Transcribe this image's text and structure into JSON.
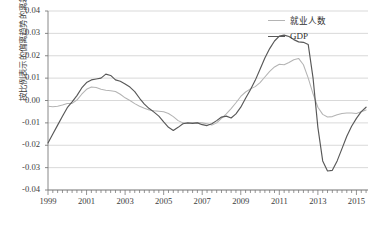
{
  "chart_data": {
    "type": "line",
    "title": "",
    "xlabel": "",
    "ylabel": "按比例表示的偏离趋势的离差",
    "xlim": [
      1999.0,
      2015.6
    ],
    "ylim": [
      -0.04,
      0.04
    ],
    "grid": true,
    "legend_position": "top-right",
    "xticks": [
      "1999",
      "2001",
      "2003",
      "2005",
      "2007",
      "2009",
      "2011",
      "2013",
      "2015"
    ],
    "xtick_values": [
      1999,
      2001,
      2003,
      2005,
      2007,
      2009,
      2011,
      2013,
      2015
    ],
    "yticks": [
      "0.04",
      "0.03",
      "0.02",
      "0.01",
      "0.00",
      "-0.01",
      "-0.02",
      "-0.03",
      "-0.04"
    ],
    "ytick_values": [
      0.04,
      0.03,
      0.02,
      0.01,
      0.0,
      -0.01,
      -0.02,
      -0.03,
      -0.04
    ],
    "minor_tick_interval": 0.25,
    "series": [
      {
        "name": "就业人数",
        "color": "#b4b4b4",
        "x": [
          1999.0,
          1999.25,
          1999.5,
          1999.75,
          2000.0,
          2000.25,
          2000.5,
          2000.75,
          2001.0,
          2001.25,
          2001.5,
          2001.75,
          2002.0,
          2002.25,
          2002.5,
          2002.75,
          2003.0,
          2003.25,
          2003.5,
          2003.75,
          2004.0,
          2004.25,
          2004.5,
          2004.75,
          2005.0,
          2005.25,
          2005.5,
          2005.75,
          2006.0,
          2006.25,
          2006.5,
          2006.75,
          2007.0,
          2007.25,
          2007.5,
          2007.75,
          2008.0,
          2008.25,
          2008.5,
          2008.75,
          2009.0,
          2009.25,
          2009.5,
          2009.75,
          2010.0,
          2010.25,
          2010.5,
          2010.75,
          2011.0,
          2011.25,
          2011.5,
          2011.75,
          2012.0,
          2012.25,
          2012.5,
          2012.75,
          2013.0,
          2013.25,
          2013.5,
          2013.75,
          2014.0,
          2014.25,
          2014.5,
          2014.75,
          2015.0,
          2015.25,
          2015.5
        ],
        "y": [
          -0.0026,
          -0.0028,
          -0.0026,
          -0.002,
          -0.0013,
          -0.0013,
          0.0002,
          0.0028,
          0.005,
          0.006,
          0.0058,
          0.005,
          0.0046,
          0.0044,
          0.004,
          0.0028,
          0.0012,
          0.0,
          -0.0014,
          -0.0026,
          -0.0035,
          -0.0042,
          -0.0046,
          -0.0048,
          -0.005,
          -0.0058,
          -0.0072,
          -0.009,
          -0.01,
          -0.0102,
          -0.01,
          -0.0098,
          -0.01,
          -0.0104,
          -0.011,
          -0.01,
          -0.008,
          -0.006,
          -0.0036,
          -0.001,
          0.0018,
          0.0038,
          0.0052,
          0.0062,
          0.008,
          0.0105,
          0.013,
          0.015,
          0.0162,
          0.016,
          0.017,
          0.0182,
          0.0188,
          0.016,
          0.01,
          0.003,
          -0.003,
          -0.0062,
          -0.0074,
          -0.0072,
          -0.0064,
          -0.0058,
          -0.0056,
          -0.0056,
          -0.0058,
          -0.005,
          -0.0042
        ],
        "note": "first half"
      },
      {
        "name": "GDP",
        "color": "#585858",
        "x": [
          1999.0,
          1999.25,
          1999.5,
          1999.75,
          2000.0,
          2000.25,
          2000.5,
          2000.75,
          2001.0,
          2001.25,
          2001.5,
          2001.75,
          2002.0,
          2002.25,
          2002.5,
          2002.75,
          2003.0,
          2003.25,
          2003.5,
          2003.75,
          2004.0,
          2004.25,
          2004.5,
          2004.75,
          2005.0,
          2005.25,
          2005.5,
          2005.75,
          2006.0,
          2006.25,
          2006.5,
          2006.75,
          2007.0,
          2007.25,
          2007.5,
          2007.75,
          2008.0,
          2008.25,
          2008.5,
          2008.75,
          2009.0,
          2009.25,
          2009.5,
          2009.75,
          2010.0,
          2010.25,
          2010.5,
          2010.75,
          2011.0,
          2011.25,
          2011.5,
          2011.75,
          2012.0,
          2012.25,
          2012.5,
          2012.75,
          2013.0,
          2013.25,
          2013.5,
          2013.75,
          2014.0,
          2014.25,
          2014.5,
          2014.75,
          2015.0,
          2015.25,
          2015.5
        ],
        "y": [
          -0.019,
          -0.015,
          -0.011,
          -0.007,
          -0.0032,
          -0.0006,
          0.0022,
          0.0056,
          0.008,
          0.0092,
          0.0096,
          0.01,
          0.0118,
          0.0112,
          0.0092,
          0.0086,
          0.0074,
          0.006,
          0.004,
          0.001,
          -0.0016,
          -0.0036,
          -0.0052,
          -0.007,
          -0.0096,
          -0.012,
          -0.0134,
          -0.012,
          -0.0104,
          -0.01,
          -0.0102,
          -0.01,
          -0.0108,
          -0.0112,
          -0.0104,
          -0.009,
          -0.0074,
          -0.007,
          -0.0078,
          -0.006,
          -0.003,
          0.001,
          0.0048,
          0.009,
          0.014,
          0.019,
          0.0232,
          0.0266,
          0.0288,
          0.0292,
          0.0286,
          0.0272,
          0.0262,
          0.026,
          0.025,
          0.01,
          -0.012,
          -0.027,
          -0.0315,
          -0.0312,
          -0.027,
          -0.0215,
          -0.016,
          -0.0115,
          -0.008,
          -0.005,
          -0.003
        ],
        "note": "first half"
      }
    ],
    "annotations": {
      "gdp_start_1999": -0.019,
      "gdp_peak_2001": 0.012,
      "gdp_trough_2003": -0.0134,
      "gdp_peak_2008": 0.0292,
      "gdp_trough_2009": -0.0315,
      "gdp_peak_2011": 0.009,
      "gdp_end_2015": 0.0095,
      "emp_peak_2001": 0.006,
      "emp_trough_2003": -0.0048,
      "emp_peak_2008": 0.0188,
      "emp_trough_2010": -0.0074,
      "emp_trough_2013": -0.0088,
      "emp_end_2015": 0.0095
    }
  },
  "legend": {
    "items": [
      {
        "label": "就业人数",
        "key": "emp"
      },
      {
        "label": "GDP",
        "key": "gdp"
      }
    ]
  },
  "caption": {
    "text": ""
  },
  "colors": {
    "employment": "#b4b4b4",
    "gdp": "#585858",
    "grid": "#cfcfcf",
    "axis": "#7a7a7a",
    "text": "#3d3d3d"
  }
}
